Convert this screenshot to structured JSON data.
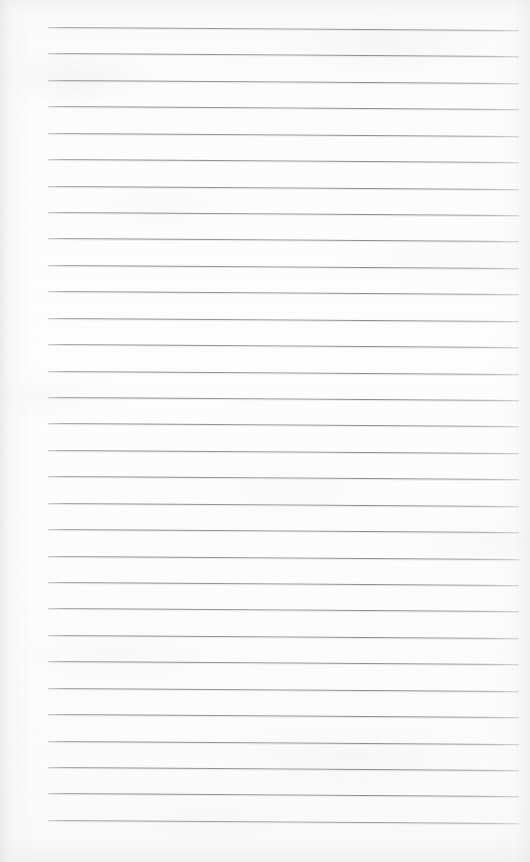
{
  "document": {
    "kind": "scanned-ruled-notepad-page",
    "title": "Blank Ruled Notepad Page",
    "page_width": 530,
    "page_height": 862,
    "paper_color": "#fdfdfc",
    "has_written_content": false,
    "written_text": "",
    "margin_rule_visible": false,
    "header_text": "",
    "footer_text": "",
    "page_number_text": ""
  },
  "ruling": {
    "line_color": "#8c8c94",
    "line_count": 31,
    "line_thickness_px": 1,
    "line_start_x": 48,
    "line_end_x": 519,
    "first_line_y": 27,
    "last_line_y": 820,
    "line_spacing_px": 26.43,
    "skew_degrees": 0.36,
    "line_y_positions": [
      27,
      53.4,
      79.9,
      106.3,
      132.7,
      159.1,
      185.6,
      212.0,
      238.4,
      264.9,
      291.3,
      317.7,
      344.1,
      370.6,
      397.0,
      423.4,
      449.9,
      476.3,
      502.7,
      529.1,
      555.6,
      582.0,
      608.4,
      634.9,
      661.3,
      687.7,
      714.1,
      740.6,
      767.0,
      793.4,
      820.0
    ]
  },
  "edges": {
    "left_shadow_color": "#e4e4e6",
    "right_shadow_color": "#e8e8eb",
    "top_shadow_color": "#ececee",
    "bottom_shadow_color": "#ebebee"
  }
}
